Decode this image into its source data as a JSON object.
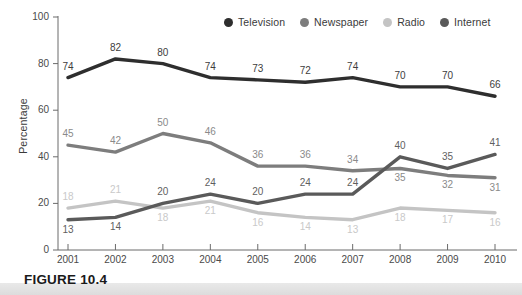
{
  "figure": {
    "caption": "FIGURE 10.4"
  },
  "axes": {
    "ylabel": "Percentage",
    "yticks": [
      "0",
      "20",
      "40",
      "60",
      "80",
      "100"
    ],
    "xticks": [
      "2001",
      "2002",
      "2003",
      "2004",
      "2005",
      "2006",
      "2007",
      "2008",
      "2009",
      "2010"
    ]
  },
  "legend": {
    "items": [
      {
        "label": "Television",
        "color": "#2e2e2e",
        "icon": "legend-dot-icon"
      },
      {
        "label": "Newspaper",
        "color": "#7d7d7d",
        "icon": "legend-dot-icon"
      },
      {
        "label": "Radio",
        "color": "#c4c4c4",
        "icon": "legend-dot-icon"
      },
      {
        "label": "Internet",
        "color": "#5a5a5a",
        "icon": "legend-dot-icon"
      }
    ]
  },
  "chart_data": {
    "type": "line",
    "title": "",
    "xlabel": "",
    "ylabel": "Percentage",
    "ylim": [
      0,
      100
    ],
    "grid": false,
    "legend_position": "top-right",
    "categories": [
      "2001",
      "2002",
      "2003",
      "2004",
      "2005",
      "2006",
      "2007",
      "2008",
      "2009",
      "2010"
    ],
    "series": [
      {
        "name": "Television",
        "color": "#2e2e2e",
        "values": [
          74,
          82,
          80,
          74,
          73,
          72,
          74,
          70,
          70,
          66
        ]
      },
      {
        "name": "Newspaper",
        "color": "#7d7d7d",
        "values": [
          45,
          42,
          50,
          46,
          36,
          36,
          34,
          35,
          32,
          31
        ]
      },
      {
        "name": "Radio",
        "color": "#c4c4c4",
        "values": [
          18,
          21,
          18,
          21,
          16,
          14,
          13,
          18,
          17,
          16
        ]
      },
      {
        "name": "Internet",
        "color": "#5a5a5a",
        "values": [
          13,
          14,
          20,
          24,
          20,
          24,
          24,
          40,
          35,
          41
        ]
      }
    ]
  }
}
